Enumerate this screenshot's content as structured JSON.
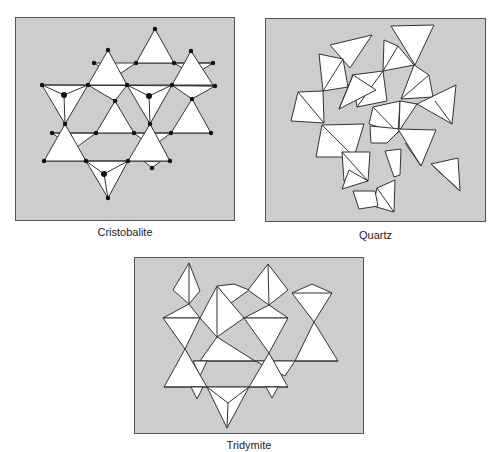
{
  "figure": {
    "panels": [
      {
        "id": "cristobalite",
        "caption": "Cristobalite"
      },
      {
        "id": "quartz",
        "caption": "Quartz"
      },
      {
        "id": "tridymite",
        "caption": "Tridymite"
      }
    ]
  },
  "colors": {
    "panel_background": "#cdcdcd",
    "tetrahedron_fill": "#ffffff",
    "edge_stroke": "#333333",
    "vertex_dot": "#111111"
  }
}
